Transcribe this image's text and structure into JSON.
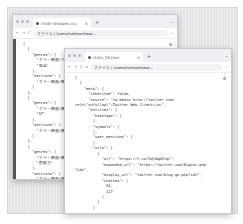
{
  "back_window": {
    "tab_title": "tmdn-shopper.csv",
    "address": "ファイル | /Users/kuhmanikesa...",
    "lines": [
      "[",
      "  {",
      "    \"genres\": [",
      "      \"ホラー映画/ホラ",
      "      \"吸血\"",
      "    ],",
      "    \"sections\": [",
      "      \"ホラー映画/映画\"",
      "    ]",
      "  },",
      "  {",
      "    \"genres\": [",
      "      \"ホラー映画/映画\"",
      "      \"SF\"",
      "    ],",
      "    \"sections\": [",
      "      \"ホラー映画/映画\"",
      "    ]",
      "  },",
      "  {",
      "    \"genres\": [",
      "      \"ホラー映画/映画\"",
      "      \"超能力\"",
      "    ],",
      "    \"sections\": [",
      "      \"ホラー映画/映画\"",
      "    ]"
    ]
  },
  "front_window": {
    "tab_title": "stats_16.json",
    "address": "ファイル | /Users/kuhmanikesa...",
    "lines": [
      "[",
      "  {",
      "    \"meta\": {",
      "      \"inherited\": false,",
      "      \"source\": \"tw-media http://twitter.com/",
      "rel=\\\"nofollow\\\">Twitter Web Client</a>\",",
      "      \"entities\": {",
      "        \"hashtags\": [",
      "",
      "        ],",
      "        \"symbols\": [",
      "",
      "        ],",
      "        \"user_mentions\": [",
      "",
      "        ],",
      "        \"urls\": [",
      "          {",
      "            \"url\": \"https://t.co/XqYdgb5tqC\",",
      "            \"expanded_url\": \"https://twitter.com/Bigcar.php",
      "?id=\",",
      "            \"display_url\": \"twitter.com/blog.go.php?id=\",",
      "            \"indices\": [",
      "              94,",
      "              117",
      "            ]",
      "          }",
      "        ]"
    ]
  },
  "icons": {
    "gear": "⚙",
    "back": "←",
    "forward": "→",
    "reload": "C",
    "home": "⌂",
    "star": "☆",
    "plus": "+",
    "chevron": "⌄"
  }
}
